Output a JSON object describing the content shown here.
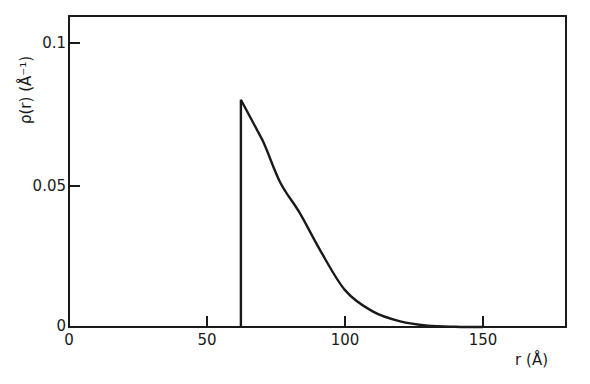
{
  "chart_data": {
    "type": "line",
    "title": "",
    "xlabel": "r (Å)",
    "ylabel": "ρ(r)  (Å⁻¹)",
    "xlim": [
      0,
      180
    ],
    "ylim": [
      0,
      0.11
    ],
    "grid": false,
    "legend": null,
    "x_ticks": [
      0,
      50,
      100,
      150
    ],
    "x_tick_labels": [
      "0",
      "50",
      "100",
      "150"
    ],
    "y_ticks": [
      0,
      0.05,
      0.1
    ],
    "y_tick_labels": [
      "0",
      "0.05",
      "0.1"
    ],
    "series": [
      {
        "name": "rho(r)",
        "x": [
          62.3,
          62.3,
          70,
          76.5,
          83.7,
          91,
          100,
          110,
          120,
          130,
          140,
          150
        ],
        "y": [
          0.0,
          0.08,
          0.066,
          0.051,
          0.04,
          0.027,
          0.013,
          0.0055,
          0.002,
          0.0005,
          0.0001,
          0.0
        ]
      }
    ]
  },
  "labels": {
    "xlabel": "r (Å)",
    "ylabel": "ρ(r)  (Å⁻¹)",
    "x0": "0",
    "x50": "50",
    "x100": "100",
    "x150": "150",
    "y0": "0",
    "y005": "0.05",
    "y01": "0.1"
  }
}
